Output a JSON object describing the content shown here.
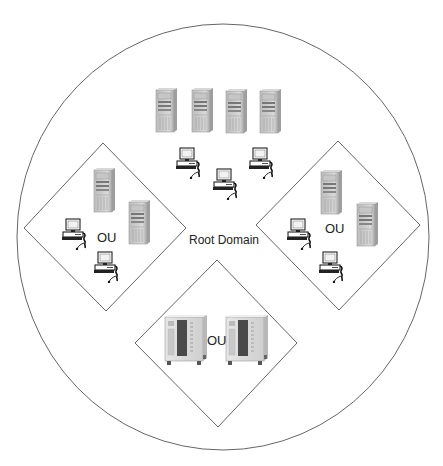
{
  "diagram": {
    "colors": {
      "background": "#ffffff",
      "outline": "#666666",
      "tower_body": "#cfcfcf",
      "tower_dark": "#8a8a8a",
      "text": "#222222"
    },
    "root_domain": {
      "label": "Root Domain",
      "shape": "ellipse",
      "cx": 223,
      "cy": 237,
      "rx": 206,
      "ry": 213,
      "label_pos": [
        189,
        234
      ],
      "servers": [
        {
          "icon": "server-tower-icon",
          "x": 155,
          "y": 88
        },
        {
          "icon": "server-tower-icon",
          "x": 191,
          "y": 88
        },
        {
          "icon": "server-tower-icon",
          "x": 225,
          "y": 89
        },
        {
          "icon": "server-tower-icon",
          "x": 259,
          "y": 89
        }
      ],
      "workstations": [
        {
          "icon": "workstation-icon",
          "x": 176,
          "y": 147
        },
        {
          "icon": "workstation-icon",
          "x": 213,
          "y": 168
        },
        {
          "icon": "workstation-icon",
          "x": 249,
          "y": 147
        }
      ]
    },
    "organizational_units": [
      {
        "id": "ou-left",
        "label": "OU",
        "diamond": {
          "top": [
            103,
            143
          ],
          "right": [
            186,
            228
          ],
          "bottom": [
            106,
            311
          ],
          "left": [
            24,
            228
          ]
        },
        "label_pos": [
          97,
          231
        ],
        "servers": [
          {
            "icon": "server-tower-icon",
            "x": 93,
            "y": 168
          },
          {
            "icon": "server-tower-icon",
            "x": 128,
            "y": 200
          }
        ],
        "workstations": [
          {
            "icon": "workstation-icon",
            "x": 62,
            "y": 218
          },
          {
            "icon": "workstation-icon",
            "x": 94,
            "y": 251
          }
        ]
      },
      {
        "id": "ou-right",
        "label": "OU",
        "diamond": {
          "top": [
            338,
            141
          ],
          "right": [
            420,
            225
          ],
          "bottom": [
            339,
            310
          ],
          "left": [
            256,
            225
          ]
        },
        "label_pos": [
          325,
          222
        ],
        "servers": [
          {
            "icon": "server-tower-icon",
            "x": 320,
            "y": 170
          },
          {
            "icon": "server-tower-icon",
            "x": 356,
            "y": 202
          }
        ],
        "workstations": [
          {
            "icon": "workstation-icon",
            "x": 287,
            "y": 218
          },
          {
            "icon": "workstation-icon",
            "x": 319,
            "y": 251
          }
        ]
      },
      {
        "id": "ou-bottom",
        "label": "OU",
        "diamond": {
          "top": [
            217,
            260
          ],
          "right": [
            297,
            343
          ],
          "bottom": [
            218,
            427
          ],
          "left": [
            135,
            343
          ]
        },
        "label_pos": [
          207,
          334
        ],
        "servers": [
          {
            "icon": "server-cabinet-icon",
            "x": 164,
            "y": 315
          },
          {
            "icon": "server-cabinet-icon",
            "x": 225,
            "y": 315
          }
        ],
        "workstations": []
      }
    ]
  }
}
